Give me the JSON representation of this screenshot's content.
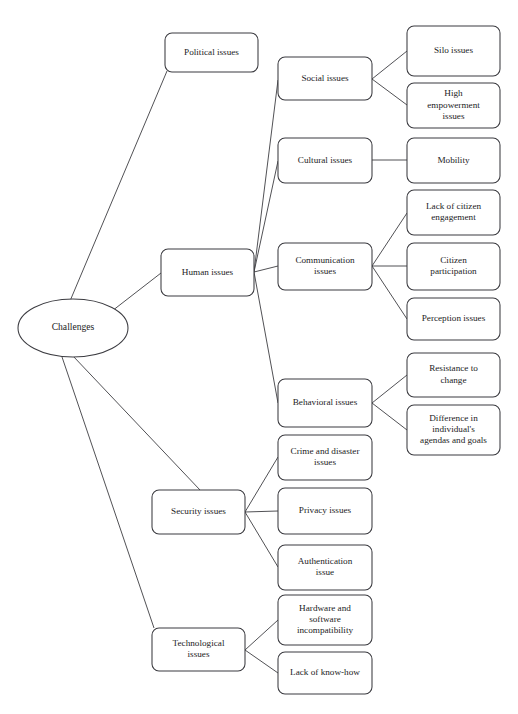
{
  "diagram": {
    "type": "tree-mind-map",
    "root": {
      "id": "challenges",
      "label": "Challenges",
      "shape": "ellipse",
      "cx": 73,
      "cy": 328,
      "rx": 55,
      "ry": 29
    },
    "level1": [
      {
        "id": "political-issues",
        "label": "Political issues",
        "x": 165,
        "y": 33,
        "w": 93,
        "h": 39
      },
      {
        "id": "human-issues",
        "label": "Human issues",
        "x": 161,
        "y": 249,
        "w": 93,
        "h": 47
      },
      {
        "id": "security-issues",
        "label": "Security issues",
        "x": 152,
        "y": 490,
        "w": 93,
        "h": 44
      },
      {
        "id": "technological-issues",
        "label": "Technological issues",
        "x": 152,
        "y": 628,
        "w": 93,
        "h": 43
      }
    ],
    "level2": [
      {
        "id": "social-issues",
        "label": "Social issues",
        "x": 278,
        "y": 57,
        "w": 94,
        "h": 43,
        "parent": "human-issues"
      },
      {
        "id": "cultural-issues",
        "label": "Cultural issues",
        "x": 278,
        "y": 138,
        "w": 94,
        "h": 45,
        "parent": "human-issues"
      },
      {
        "id": "communication-issues",
        "label": "Communication issues",
        "x": 278,
        "y": 243,
        "w": 94,
        "h": 47,
        "parent": "human-issues"
      },
      {
        "id": "behavioral-issues",
        "label": "Behavioral issues",
        "x": 278,
        "y": 379,
        "w": 94,
        "h": 48,
        "parent": "human-issues"
      },
      {
        "id": "crime-disaster-issues",
        "label": "Crime and disaster issues",
        "x": 278,
        "y": 435,
        "w": 94,
        "h": 45,
        "parent": "security-issues"
      },
      {
        "id": "privacy-issues",
        "label": "Privacy issues",
        "x": 278,
        "y": 488,
        "w": 94,
        "h": 46,
        "parent": "security-issues"
      },
      {
        "id": "authentication-issue",
        "label": "Authentication issue",
        "x": 278,
        "y": 545,
        "w": 94,
        "h": 45,
        "parent": "security-issues"
      },
      {
        "id": "hardware-software-incompatibility",
        "label": "Hardware and software incompatibility",
        "x": 278,
        "y": 595,
        "w": 94,
        "h": 50,
        "parent": "technological-issues"
      },
      {
        "id": "lack-of-know-how",
        "label": "Lack of know-how",
        "x": 278,
        "y": 652,
        "w": 94,
        "h": 42,
        "parent": "technological-issues"
      }
    ],
    "level3": [
      {
        "id": "silo-issues",
        "label": "Silo issues",
        "x": 407,
        "y": 26,
        "w": 93,
        "h": 50,
        "parent": "social-issues"
      },
      {
        "id": "high-empowerment-issues",
        "label": "High empowerment issues",
        "x": 407,
        "y": 83,
        "w": 93,
        "h": 45,
        "parent": "social-issues"
      },
      {
        "id": "mobility",
        "label": "Mobility",
        "x": 407,
        "y": 138,
        "w": 93,
        "h": 45,
        "parent": "cultural-issues"
      },
      {
        "id": "lack-of-citizen-engagement",
        "label": "Lack of citizen engagement",
        "x": 407,
        "y": 190,
        "w": 93,
        "h": 45,
        "parent": "communication-issues"
      },
      {
        "id": "citizen-participation",
        "label": "Citizen participation",
        "x": 407,
        "y": 243,
        "w": 93,
        "h": 47,
        "parent": "communication-issues"
      },
      {
        "id": "perception-issues",
        "label": "Perception issues",
        "x": 407,
        "y": 298,
        "w": 93,
        "h": 42,
        "parent": "communication-issues"
      },
      {
        "id": "resistance-to-change",
        "label": "Resistance to change",
        "x": 407,
        "y": 353,
        "w": 93,
        "h": 44,
        "parent": "behavioral-issues"
      },
      {
        "id": "difference-in-individuals-agendas-and-goals",
        "label": "Difference in individual's agendas and goals",
        "x": 407,
        "y": 405,
        "w": 93,
        "h": 50,
        "parent": "behavioral-issues"
      }
    ],
    "label_lines": {
      "challenges": [
        "Challenges"
      ],
      "political-issues": [
        "Political issues"
      ],
      "human-issues": [
        "Human issues"
      ],
      "security-issues": [
        "Security issues"
      ],
      "technological-issues": [
        "Technological",
        "issues"
      ],
      "social-issues": [
        "Social issues"
      ],
      "cultural-issues": [
        "Cultural issues"
      ],
      "communication-issues": [
        "Communication",
        "issues"
      ],
      "behavioral-issues": [
        "Behavioral issues"
      ],
      "crime-disaster-issues": [
        "Crime and disaster",
        "issues"
      ],
      "privacy-issues": [
        "Privacy issues"
      ],
      "authentication-issue": [
        "Authentication",
        "issue"
      ],
      "hardware-software-incompatibility": [
        "Hardware and",
        "software",
        "incompatibility"
      ],
      "lack-of-know-how": [
        "Lack of know-how"
      ],
      "silo-issues": [
        "Silo issues"
      ],
      "high-empowerment-issues": [
        "High",
        "empowerment",
        "issues"
      ],
      "mobility": [
        "Mobility"
      ],
      "lack-of-citizen-engagement": [
        "Lack of citizen",
        "engagement"
      ],
      "citizen-participation": [
        "Citizen",
        "participation"
      ],
      "perception-issues": [
        "Perception issues"
      ],
      "resistance-to-change": [
        "Resistance to",
        "change"
      ],
      "difference-in-individuals-agendas-and-goals": [
        "Difference in",
        "individual's",
        "agendas and goals"
      ]
    },
    "edges": [
      {
        "from": "challenges",
        "to": "political-issues",
        "x1": 70,
        "y1": 301,
        "x2": 167,
        "y2": 71
      },
      {
        "from": "challenges",
        "to": "human-issues",
        "x1": 112,
        "y1": 311,
        "x2": 161,
        "y2": 273
      },
      {
        "from": "challenges",
        "to": "security-issues",
        "x1": 73,
        "y1": 356,
        "x2": 200,
        "y2": 490
      },
      {
        "from": "challenges",
        "to": "technological-issues",
        "x1": 61,
        "y1": 354,
        "x2": 154,
        "y2": 628
      },
      {
        "from": "human-issues",
        "to": "social-issues",
        "x1": 254,
        "y1": 272,
        "x2": 278,
        "y2": 80
      },
      {
        "from": "human-issues",
        "to": "cultural-issues",
        "x1": 254,
        "y1": 272,
        "x2": 278,
        "y2": 161
      },
      {
        "from": "human-issues",
        "to": "communication-issues",
        "x1": 254,
        "y1": 272,
        "x2": 278,
        "y2": 266
      },
      {
        "from": "human-issues",
        "to": "behavioral-issues",
        "x1": 254,
        "y1": 272,
        "x2": 278,
        "y2": 403
      },
      {
        "from": "social-issues",
        "to": "silo-issues",
        "x1": 372,
        "y1": 79,
        "x2": 407,
        "y2": 51
      },
      {
        "from": "social-issues",
        "to": "high-empowerment-issues",
        "x1": 372,
        "y1": 79,
        "x2": 407,
        "y2": 105
      },
      {
        "from": "cultural-issues",
        "to": "mobility",
        "x1": 372,
        "y1": 160,
        "x2": 407,
        "y2": 160
      },
      {
        "from": "communication-issues",
        "to": "lack-of-citizen-engagement",
        "x1": 372,
        "y1": 266,
        "x2": 407,
        "y2": 213
      },
      {
        "from": "communication-issues",
        "to": "citizen-participation",
        "x1": 372,
        "y1": 266,
        "x2": 407,
        "y2": 266
      },
      {
        "from": "communication-issues",
        "to": "perception-issues",
        "x1": 372,
        "y1": 266,
        "x2": 407,
        "y2": 319
      },
      {
        "from": "behavioral-issues",
        "to": "resistance-to-change",
        "x1": 372,
        "y1": 403,
        "x2": 407,
        "y2": 375
      },
      {
        "from": "behavioral-issues",
        "to": "difference-in-individuals-agendas-and-goals",
        "x1": 372,
        "y1": 403,
        "x2": 407,
        "y2": 430
      },
      {
        "from": "security-issues",
        "to": "crime-disaster-issues",
        "x1": 245,
        "y1": 512,
        "x2": 278,
        "y2": 457
      },
      {
        "from": "security-issues",
        "to": "privacy-issues",
        "x1": 245,
        "y1": 512,
        "x2": 278,
        "y2": 511
      },
      {
        "from": "security-issues",
        "to": "authentication-issue",
        "x1": 245,
        "y1": 512,
        "x2": 278,
        "y2": 567
      },
      {
        "from": "technological-issues",
        "to": "hardware-software-incompatibility",
        "x1": 245,
        "y1": 650,
        "x2": 278,
        "y2": 620
      },
      {
        "from": "technological-issues",
        "to": "lack-of-know-how",
        "x1": 245,
        "y1": 650,
        "x2": 278,
        "y2": 673
      }
    ],
    "style": {
      "stroke": "#3b3b40",
      "edge_stroke": "#3d3d42",
      "fill": "#ffffff",
      "text": "#1c1c1e",
      "background": "#ffffff",
      "corner_radius": 7
    }
  }
}
